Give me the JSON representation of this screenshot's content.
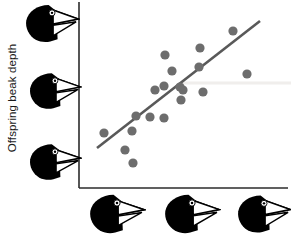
{
  "figure": {
    "title": "",
    "background_color": "#ffffff"
  },
  "axes": {
    "y_axis_label": "Offspring beak depth",
    "x_axis_label": "",
    "axis_color": "#2b2b2b",
    "y_axis_line": {
      "x": 79,
      "y_top": 2,
      "y_bottom": 188
    },
    "x_axis_line": {
      "y": 188,
      "x_left": 79,
      "x_right": 288
    },
    "y_tick_labels": [],
    "x_tick_labels": [],
    "grid": false
  },
  "icons": {
    "y_axis_birds": [
      {
        "name": "finch-head-icon-large-beak",
        "x": 24,
        "y": 3,
        "w": 56,
        "h": 41,
        "beak": "large"
      },
      {
        "name": "finch-head-icon-medium-beak",
        "x": 28,
        "y": 71,
        "w": 54,
        "h": 40,
        "beak": "medium"
      },
      {
        "name": "finch-head-icon-small-beak",
        "x": 28,
        "y": 142,
        "w": 54,
        "h": 40,
        "beak": "small"
      }
    ],
    "x_axis_birds": [
      {
        "name": "finch-head-icon-small-beak",
        "x": 88,
        "y": 193,
        "w": 58,
        "h": 42,
        "beak": "small"
      },
      {
        "name": "finch-head-icon-medium-beak",
        "x": 163,
        "y": 193,
        "w": 58,
        "h": 42,
        "beak": "medium"
      },
      {
        "name": "finch-head-icon-large-beak",
        "x": 236,
        "y": 193,
        "w": 56,
        "h": 42,
        "beak": "large"
      }
    ]
  },
  "chart_data": {
    "type": "scatter",
    "title": "",
    "xlabel": "Parental beak depth",
    "ylabel": "Offspring beak depth",
    "xlim": [
      79,
      288
    ],
    "ylim": [
      2,
      188
    ],
    "grid": false,
    "legend": null,
    "point_color": "#6d6d6d",
    "point_radius": 4.6,
    "points": [
      {
        "x": 104,
        "y": 133
      },
      {
        "x": 133,
        "y": 163
      },
      {
        "x": 125,
        "y": 150
      },
      {
        "x": 132,
        "y": 131
      },
      {
        "x": 136,
        "y": 116
      },
      {
        "x": 150,
        "y": 117
      },
      {
        "x": 155,
        "y": 90
      },
      {
        "x": 164,
        "y": 118
      },
      {
        "x": 165,
        "y": 55
      },
      {
        "x": 172,
        "y": 71
      },
      {
        "x": 164,
        "y": 86
      },
      {
        "x": 180,
        "y": 87
      },
      {
        "x": 181,
        "y": 100
      },
      {
        "x": 183,
        "y": 90
      },
      {
        "x": 199,
        "y": 67
      },
      {
        "x": 200,
        "y": 48
      },
      {
        "x": 203,
        "y": 92
      },
      {
        "x": 233,
        "y": 31
      },
      {
        "x": 247,
        "y": 74
      }
    ],
    "trendline": {
      "name": "regression-line",
      "color": "#595959",
      "width": 2.6,
      "x1": 97,
      "y1": 148,
      "x2": 260,
      "y2": 21
    },
    "reference_band": {
      "name": "faint-horizontal-line",
      "color": "#f0eeec",
      "y": 83,
      "x1": 180,
      "x2": 291,
      "thickness": 3
    }
  }
}
